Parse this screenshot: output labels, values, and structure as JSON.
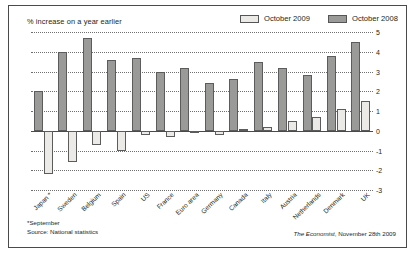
{
  "figure": {
    "subtitle": "% increase on a year earlier",
    "footnote_line1": "*September",
    "footnote_line2": "Source: National statistics",
    "source_brand": "The Economist",
    "source_rest": ", November 28th 2009",
    "colors": {
      "light_series": "#eceae6",
      "dark_series": "#9a9a98",
      "border": "#4a4a4a",
      "grid": "#6f6f6f",
      "text": "#231f20"
    }
  },
  "legend": {
    "position": "top-right",
    "entries": [
      {
        "label": "October 2009",
        "swatch": "light"
      },
      {
        "label": "October 2008",
        "swatch": "dark"
      }
    ]
  },
  "chart_data": {
    "type": "bar",
    "title": "",
    "subtitle": "% increase on a year earlier",
    "xlabel": "",
    "ylabel": "% increase on a year earlier",
    "ylim": [
      -3,
      5
    ],
    "yticks": [
      5,
      4,
      3,
      2,
      1,
      0,
      -1,
      -2,
      -3
    ],
    "ytick_labels": [
      "5",
      "4",
      "3",
      "2",
      "1",
      "0",
      "-1",
      "-2",
      "-3"
    ],
    "grid": true,
    "grid_style": "dotted-horizontal",
    "legend_position": "top-right",
    "categories": [
      "Japan *",
      "Sweden",
      "Belgium",
      "Spain",
      "US",
      "France",
      "Euro area",
      "Germany",
      "Canada",
      "Italy",
      "Austria",
      "Netherlands",
      "Denmark",
      "UK"
    ],
    "series": [
      {
        "name": "October 2009",
        "color": "#eceae6",
        "values": [
          -2.2,
          -1.6,
          -0.7,
          -1.0,
          -0.2,
          -0.3,
          -0.1,
          -0.2,
          0.1,
          0.2,
          0.5,
          0.7,
          1.1,
          1.5
        ]
      },
      {
        "name": "October 2008",
        "color": "#9a9a98",
        "values": [
          2.0,
          4.0,
          4.7,
          3.6,
          3.7,
          3.0,
          3.2,
          2.4,
          2.6,
          3.5,
          3.2,
          2.8,
          3.8,
          4.5
        ]
      }
    ]
  }
}
